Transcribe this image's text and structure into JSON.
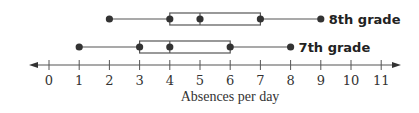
{
  "chart_data": {
    "type": "boxplot",
    "title": "",
    "xlabel": "Absences per day",
    "ylabel": "",
    "xlim": [
      0,
      11
    ],
    "x_ticks": [
      0,
      1,
      2,
      3,
      4,
      5,
      6,
      7,
      8,
      9,
      10,
      11
    ],
    "grid": false,
    "legend": "inline labels right of each box plot",
    "series": [
      {
        "name": "8th grade",
        "min": 2,
        "q1": 4,
        "median": 5,
        "q3": 7,
        "max": 9
      },
      {
        "name": "7th grade",
        "min": 1,
        "q1": 3,
        "median": 4,
        "q3": 6,
        "max": 8
      }
    ],
    "colors": {
      "line": "#555555",
      "point": "#333333",
      "text": "#222222"
    }
  },
  "labels": {
    "series_8th": "8th grade",
    "series_7th": "7th grade",
    "axis_title": "Absences per day",
    "ticks": [
      "0",
      "1",
      "2",
      "3",
      "4",
      "5",
      "6",
      "7",
      "8",
      "9",
      "10",
      "11"
    ]
  }
}
